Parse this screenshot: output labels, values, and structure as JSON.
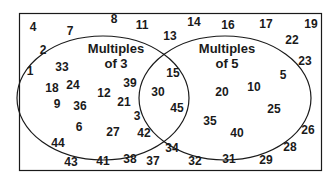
{
  "diagram": {
    "type": "venn",
    "sets": [
      {
        "label_line1": "Multiples",
        "label_line2": "of 3"
      },
      {
        "label_line1": "Multiples",
        "label_line2": "of 5"
      }
    ],
    "outside": [
      {
        "v": "4",
        "x": 33,
        "y": 27
      },
      {
        "v": "7",
        "x": 70,
        "y": 31
      },
      {
        "v": "8",
        "x": 114,
        "y": 19
      },
      {
        "v": "11",
        "x": 142,
        "y": 25
      },
      {
        "v": "13",
        "x": 170,
        "y": 36
      },
      {
        "v": "14",
        "x": 194,
        "y": 22
      },
      {
        "v": "16",
        "x": 228,
        "y": 25
      },
      {
        "v": "17",
        "x": 266,
        "y": 24
      },
      {
        "v": "19",
        "x": 311,
        "y": 24
      },
      {
        "v": "22",
        "x": 292,
        "y": 40
      },
      {
        "v": "2",
        "x": 43,
        "y": 50
      },
      {
        "v": "23",
        "x": 305,
        "y": 61
      },
      {
        "v": "1",
        "x": 30,
        "y": 71
      },
      {
        "v": "26",
        "x": 308,
        "y": 130
      },
      {
        "v": "44",
        "x": 58,
        "y": 143
      },
      {
        "v": "28",
        "x": 290,
        "y": 147
      },
      {
        "v": "34",
        "x": 172,
        "y": 148
      },
      {
        "v": "43",
        "x": 71,
        "y": 162
      },
      {
        "v": "41",
        "x": 103,
        "y": 161
      },
      {
        "v": "38",
        "x": 130,
        "y": 159
      },
      {
        "v": "37",
        "x": 153,
        "y": 161
      },
      {
        "v": "32",
        "x": 195,
        "y": 161
      },
      {
        "v": "31",
        "x": 229,
        "y": 159
      },
      {
        "v": "29",
        "x": 266,
        "y": 160
      }
    ],
    "only_set_a": [
      {
        "v": "33",
        "x": 62,
        "y": 67
      },
      {
        "v": "18",
        "x": 52,
        "y": 88
      },
      {
        "v": "24",
        "x": 73,
        "y": 85
      },
      {
        "v": "12",
        "x": 104,
        "y": 93
      },
      {
        "v": "39",
        "x": 130,
        "y": 83
      },
      {
        "v": "9",
        "x": 57,
        "y": 104
      },
      {
        "v": "36",
        "x": 80,
        "y": 106
      },
      {
        "v": "21",
        "x": 124,
        "y": 102
      },
      {
        "v": "3",
        "x": 137,
        "y": 116
      },
      {
        "v": "6",
        "x": 79,
        "y": 127
      },
      {
        "v": "27",
        "x": 113,
        "y": 132
      },
      {
        "v": "42",
        "x": 144,
        "y": 133
      }
    ],
    "intersection": [
      {
        "v": "15",
        "x": 173,
        "y": 73
      },
      {
        "v": "30",
        "x": 158,
        "y": 92
      },
      {
        "v": "45",
        "x": 177,
        "y": 108
      }
    ],
    "only_set_b": [
      {
        "v": "20",
        "x": 222,
        "y": 92
      },
      {
        "v": "10",
        "x": 254,
        "y": 87
      },
      {
        "v": "5",
        "x": 283,
        "y": 75
      },
      {
        "v": "25",
        "x": 274,
        "y": 109
      },
      {
        "v": "35",
        "x": 210,
        "y": 121
      },
      {
        "v": "40",
        "x": 237,
        "y": 133
      }
    ]
  }
}
